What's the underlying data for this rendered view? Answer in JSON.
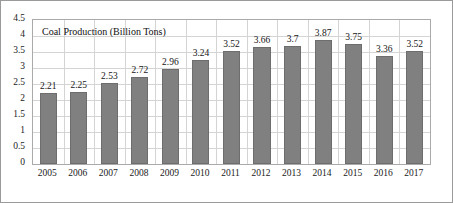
{
  "chart_data": {
    "type": "bar",
    "title": "Coal Production (Billion Tons)",
    "xlabel": "",
    "ylabel": "",
    "categories": [
      "2005",
      "2006",
      "2007",
      "2008",
      "2009",
      "2010",
      "2011",
      "2012",
      "2013",
      "2014",
      "2015",
      "2016",
      "2017"
    ],
    "values": [
      2.21,
      2.25,
      2.53,
      2.72,
      2.96,
      3.24,
      3.52,
      3.66,
      3.7,
      3.87,
      3.75,
      3.36,
      3.52
    ],
    "data_labels": [
      "2.21",
      "2.25",
      "2.53",
      "2.72",
      "2.96",
      "3.24",
      "3.52",
      "3.66",
      "3.7",
      "3.87",
      "3.75",
      "3.36",
      "3.52"
    ],
    "ylim": [
      0,
      4.5
    ],
    "ytick_values": [
      0,
      0.5,
      1,
      1.5,
      2,
      2.5,
      3,
      3.5,
      4,
      4.5
    ],
    "ytick_labels": [
      "0",
      "0.5",
      "1",
      "1.5",
      "2",
      "2.5",
      "3",
      "3.5",
      "4",
      "4.5"
    ],
    "grid": {
      "horizontal": true,
      "vertical": true,
      "color": "#d4d4d4"
    },
    "legend": {
      "visible": false,
      "position": "none"
    },
    "series_color": "#808080",
    "series_border_color": "#6d6d6d",
    "plot_border_color": "#aaaaaa",
    "figure_border_color": "#9a9a9a",
    "background_color": "#ffffff",
    "text_color": "#1a1a1a"
  }
}
